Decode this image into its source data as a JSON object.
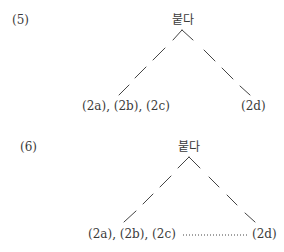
{
  "diagrams": [
    {
      "number": "(5)",
      "root": "붙다",
      "left_leaf": "(2a), (2b), (2c)",
      "right_leaf": "(2d)",
      "leaf_connector": "none"
    },
    {
      "number": "(6)",
      "root": "붙다",
      "left_leaf": "(2a), (2b), (2c)",
      "right_leaf": "(2d)",
      "leaf_connector": "dotted"
    }
  ],
  "colors": {
    "line": "#444444",
    "text": "#3a3a3a"
  }
}
